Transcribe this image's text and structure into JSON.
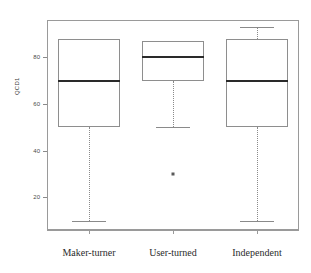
{
  "chart_data": {
    "type": "box",
    "title": "",
    "xlabel": "",
    "ylabel": "QCD1",
    "ylim": [
      6,
      96
    ],
    "yticks": [
      20,
      40,
      60,
      80
    ],
    "ytick_labels": [
      "20",
      "40",
      "60",
      "80"
    ],
    "grid": false,
    "legend": null,
    "categories": [
      "Maker-turner",
      "User-turned",
      "Independent"
    ],
    "boxes": [
      {
        "category": "Maker-turner",
        "whisker_low": 10,
        "q1": 50,
        "median": 70,
        "q3": 88,
        "whisker_high": 88,
        "outliers": []
      },
      {
        "category": "User-turned",
        "whisker_low": 50,
        "q1": 70,
        "median": 80,
        "q3": 87,
        "whisker_high": 87,
        "outliers": [
          30
        ]
      },
      {
        "category": "Independent",
        "whisker_low": 10,
        "q1": 50,
        "median": 70,
        "q3": 88,
        "whisker_high": 93,
        "outliers": []
      }
    ],
    "colors": {
      "box_stroke": "#8e8e8e",
      "median_stroke": "#2a2a2a",
      "whisker_stroke": "#8a8a8a",
      "outlier_fill": "#5a5a5a",
      "axis": "#9a9a9a",
      "background": "#ffffff"
    }
  }
}
